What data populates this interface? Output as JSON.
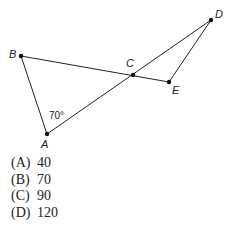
{
  "figure": {
    "points": {
      "A": {
        "label": "A"
      },
      "B": {
        "label": "B"
      },
      "C": {
        "label": "C"
      },
      "D": {
        "label": "D"
      },
      "E": {
        "label": "E"
      }
    },
    "angle_label": "70°"
  },
  "choices": [
    {
      "key": "(A)",
      "value": "40"
    },
    {
      "key": "(B)",
      "value": "70"
    },
    {
      "key": "(C)",
      "value": "90"
    },
    {
      "key": "(D)",
      "value": "120"
    }
  ]
}
